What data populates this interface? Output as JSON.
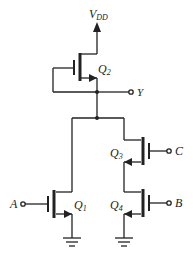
{
  "diagram": {
    "type": "cmos-logic-circuit",
    "supply_label": "V",
    "supply_subscript": "DD",
    "output_label": "Y",
    "inputs": [
      {
        "id": "A",
        "label": "A"
      },
      {
        "id": "B",
        "label": "B"
      },
      {
        "id": "C",
        "label": "C"
      }
    ],
    "transistors": [
      {
        "id": "Q1",
        "label": "Q",
        "sub": "1",
        "gate": "A"
      },
      {
        "id": "Q2",
        "label": "Q",
        "sub": "2",
        "gate": "Y"
      },
      {
        "id": "Q3",
        "label": "Q",
        "sub": "3",
        "gate": "C"
      },
      {
        "id": "Q4",
        "label": "Q",
        "sub": "4",
        "gate": "B"
      }
    ],
    "line_color": "#222222"
  }
}
